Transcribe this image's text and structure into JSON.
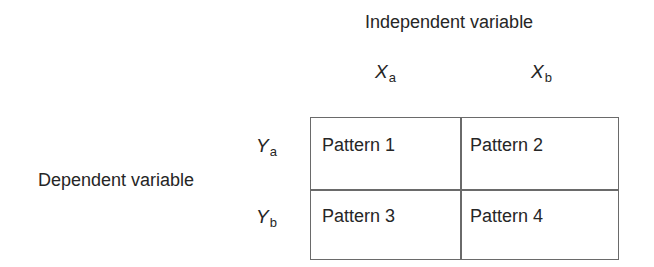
{
  "diagram": {
    "independent_variable_label": "Independent variable",
    "dependent_variable_label": "Dependent variable",
    "columns": [
      {
        "symbol": "X",
        "subscript": "a"
      },
      {
        "symbol": "X",
        "subscript": "b"
      }
    ],
    "rows": [
      {
        "symbol": "Y",
        "subscript": "a"
      },
      {
        "symbol": "Y",
        "subscript": "b"
      }
    ],
    "cells": [
      [
        "Pattern 1",
        "Pattern 2"
      ],
      [
        "Pattern 3",
        "Pattern 4"
      ]
    ]
  }
}
